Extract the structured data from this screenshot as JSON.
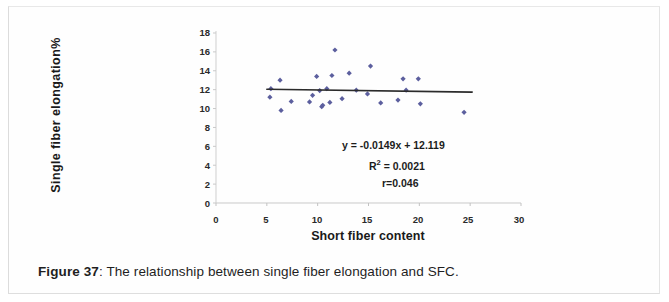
{
  "figure": {
    "caption_bold": "Figure 37",
    "caption_rest": ": The relationship between single fiber elongation and SFC."
  },
  "chart_data": {
    "type": "scatter",
    "title": "",
    "xlabel": "Short fiber content",
    "ylabel": "Single fiber  elongation%",
    "xlim": [
      0,
      30
    ],
    "ylim": [
      0,
      18
    ],
    "xticks": [
      0,
      5,
      10,
      15,
      20,
      25,
      30
    ],
    "yticks": [
      0,
      2,
      4,
      6,
      8,
      10,
      12,
      14,
      16,
      18
    ],
    "grid": false,
    "legend": "none",
    "marker_color": "#5c5f9e",
    "trendline_color": "#2b2b2b",
    "annotations": {
      "equation": "y = -0.0149x + 12.119",
      "r_squared_prefix": "R",
      "r_squared_sup": "2",
      "r_squared_value": " = 0.0021",
      "correlation": "r=0.046"
    },
    "trendline": {
      "slope": -0.0149,
      "intercept": 12.119,
      "x_start": 5.0,
      "x_end": 25.2
    },
    "series": [
      {
        "name": "Single fiber elongation",
        "points": [
          [
            5.3,
            11.2
          ],
          [
            5.4,
            12.1
          ],
          [
            6.3,
            13.0
          ],
          [
            6.4,
            9.8
          ],
          [
            7.4,
            10.75
          ],
          [
            9.2,
            10.7
          ],
          [
            9.5,
            11.4
          ],
          [
            9.9,
            13.4
          ],
          [
            10.2,
            11.9
          ],
          [
            10.4,
            10.2
          ],
          [
            10.5,
            10.35
          ],
          [
            10.9,
            12.1
          ],
          [
            11.2,
            10.65
          ],
          [
            11.4,
            13.5
          ],
          [
            11.7,
            16.2
          ],
          [
            12.4,
            11.05
          ],
          [
            13.1,
            13.75
          ],
          [
            13.8,
            11.95
          ],
          [
            14.9,
            11.55
          ],
          [
            15.2,
            14.5
          ],
          [
            16.2,
            10.6
          ],
          [
            17.9,
            10.9
          ],
          [
            18.4,
            13.15
          ],
          [
            18.7,
            11.95
          ],
          [
            19.9,
            13.15
          ],
          [
            20.1,
            10.5
          ],
          [
            24.4,
            9.6
          ]
        ]
      }
    ]
  }
}
